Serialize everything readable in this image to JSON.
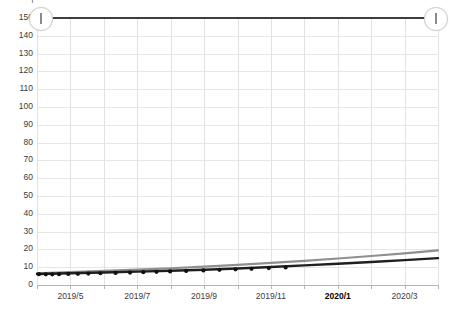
{
  "toolbar": {
    "glyph_1": "▬",
    "glyph_2": "│",
    "glyph_3": "┄"
  },
  "slider": {
    "handle_left_label": "range-min-handle",
    "handle_right_label": "range-max-handle",
    "min_value": "150",
    "max_value": "150"
  },
  "chart_data": {
    "type": "line",
    "title": "",
    "subtitle": "",
    "xlabel": "",
    "ylabel": "",
    "grid": true,
    "legend": "none",
    "ylim": [
      0,
      150
    ],
    "yticks": [
      0,
      10,
      20,
      30,
      40,
      50,
      60,
      70,
      80,
      90,
      100,
      110,
      120,
      130,
      140,
      150
    ],
    "ytick_labels": [
      "0",
      "10",
      "20",
      "30",
      "40",
      "50",
      "60",
      "70",
      "80",
      "90",
      "100",
      "110",
      "120",
      "130",
      "140",
      "150"
    ],
    "xtick_labels": [
      "2019/5",
      "2019/7",
      "2019/9",
      "2019/11",
      "2020/1",
      "2020/3"
    ],
    "x_current_label": "2020/1",
    "x": [
      "2019/4",
      "2019/5",
      "2019/6",
      "2019/7",
      "2019/8",
      "2019/9",
      "2019/10",
      "2019/11",
      "2019/12",
      "2020/1",
      "2020/2",
      "2020/3",
      "2020/4"
    ],
    "series": [
      {
        "name": "upper-trend",
        "color": "#8f8f8f",
        "style": "line",
        "markers": false,
        "values": [
          6.5,
          7.2,
          7.9,
          8.6,
          9.4,
          10.3,
          11.3,
          12.4,
          13.6,
          14.9,
          16.3,
          17.8,
          19.4
        ]
      },
      {
        "name": "lower-trend",
        "color": "#1f1f1f",
        "style": "line",
        "markers": true,
        "values": [
          6.2,
          6.6,
          7.0,
          7.5,
          8.0,
          8.6,
          9.3,
          10.1,
          11.0,
          11.9,
          12.9,
          14.0,
          15.1
        ]
      }
    ],
    "markers": {
      "color": "#111111",
      "x_frac": [
        0.005,
        0.022,
        0.038,
        0.055,
        0.078,
        0.102,
        0.128,
        0.158,
        0.196,
        0.232,
        0.265,
        0.298,
        0.332,
        0.372,
        0.415,
        0.455,
        0.495,
        0.535,
        0.578,
        0.62
      ],
      "y_value": [
        6.1,
        6.0,
        6.0,
        6.1,
        6.2,
        6.3,
        6.4,
        6.6,
        6.8,
        7.0,
        7.2,
        7.4,
        7.6,
        7.9,
        8.2,
        8.5,
        8.8,
        9.1,
        9.5,
        9.9
      ]
    }
  }
}
